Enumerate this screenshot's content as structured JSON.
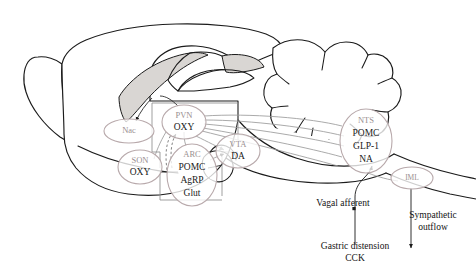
{
  "figure": {
    "type": "diagram",
    "background_color": "#ffffff",
    "outline_color": "#1b1b1b",
    "oval_stroke_color": "#b8a9ab",
    "oval_title_color": "#9a8f90",
    "connector_color": "#9b9b9b",
    "text_color": "#141414"
  },
  "nodes": [
    {
      "id": "nac",
      "name": "Nac",
      "lines": [
        "Nac"
      ],
      "title_only": true,
      "cx": 129,
      "cy": 131,
      "rx": 25,
      "ry": 12
    },
    {
      "id": "pvn",
      "name": "PVN",
      "lines": [
        "PVN",
        "OXY"
      ],
      "title_only": false,
      "cx": 184,
      "cy": 122,
      "rx": 22,
      "ry": 17
    },
    {
      "id": "son",
      "name": "SON",
      "lines": [
        "SON",
        "OXY"
      ],
      "title_only": false,
      "cx": 140,
      "cy": 167,
      "rx": 22,
      "ry": 17
    },
    {
      "id": "arc",
      "name": "ARC",
      "lines": [
        "ARC",
        "POMC",
        "AgRP",
        "Glut"
      ],
      "title_only": false,
      "cx": 192,
      "cy": 175,
      "rx": 25,
      "ry": 31
    },
    {
      "id": "vta",
      "name": "VTA",
      "lines": [
        "VTA",
        "DA"
      ],
      "title_only": false,
      "cx": 238,
      "cy": 151,
      "rx": 22,
      "ry": 17
    },
    {
      "id": "nts",
      "name": "NTS",
      "lines": [
        "NTS",
        "POMC",
        "GLP-1",
        "NA"
      ],
      "title_only": false,
      "cx": 366,
      "cy": 141,
      "rx": 26,
      "ry": 32
    },
    {
      "id": "iml",
      "name": "IML",
      "lines": [
        "IML"
      ],
      "title_only": true,
      "cx": 412,
      "cy": 178,
      "rx": 21,
      "ry": 11
    }
  ],
  "annotations": [
    {
      "id": "vagal-afferent",
      "text": "Vagal afferent",
      "x": 343,
      "y": 204
    },
    {
      "id": "gastric-distension",
      "text": "Gastric distension",
      "x": 355,
      "y": 247
    },
    {
      "id": "cck",
      "text": "CCK",
      "x": 355,
      "y": 259
    },
    {
      "id": "sympathetic",
      "text": "Sympathetic",
      "x": 433,
      "y": 216
    },
    {
      "id": "outflow",
      "text": "outflow",
      "x": 433,
      "y": 228
    }
  ],
  "node_text": {
    "nac": {
      "l0": "Nac"
    },
    "pvn": {
      "l0": "PVN",
      "l1": "OXY"
    },
    "son": {
      "l0": "SON",
      "l1": "OXY"
    },
    "arc": {
      "l0": "ARC",
      "l1": "POMC",
      "l2": "AgRP",
      "l3": "Glut"
    },
    "vta": {
      "l0": "VTA",
      "l1": "DA"
    },
    "nts": {
      "l0": "NTS",
      "l1": "POMC",
      "l2": "GLP-1",
      "l3": "NA"
    },
    "iml": {
      "l0": "IML"
    }
  },
  "labels": {
    "vagal_afferent": "Vagal afferent",
    "gastric_distension": "Gastric distension",
    "cck": "CCK",
    "sympathetic": "Sympathetic",
    "outflow": "outflow"
  }
}
